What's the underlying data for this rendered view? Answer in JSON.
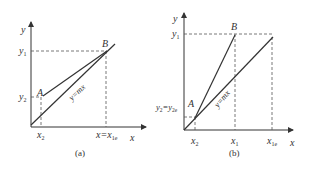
{
  "colors": {
    "line": "#333333",
    "dashed": "#555555",
    "background": "#ffffff"
  },
  "panel_a": {
    "caption": "(a)",
    "axis_x_label": "x",
    "axis_y_label": "y",
    "point_a_label": "A",
    "point_b_label": "B",
    "line_label": "y=mx",
    "y_tick_1": "y",
    "y_tick_1_sub": "1",
    "y_tick_2": "y",
    "y_tick_2_sub": "2",
    "x_tick_2": "x",
    "x_tick_2_sub": "2",
    "x_tick_1e": "x=x",
    "x_tick_1e_sub": "1e"
  },
  "panel_b": {
    "caption": "(b)",
    "axis_x_label": "x",
    "axis_y_label": "y",
    "point_a_label": "A",
    "point_b_label": "B",
    "line_label": "y=mx",
    "y_tick_1": "y",
    "y_tick_1_sub": "1",
    "y_tick_2": "y",
    "y_tick_2_sub": "2",
    "y_tick_2e_eq": "=y",
    "y_tick_2e_sub": "2e",
    "x_tick_2": "x",
    "x_tick_2_sub": "2",
    "x_tick_1": "x",
    "x_tick_1_sub": "1",
    "x_tick_1e": "x",
    "x_tick_1e_sub": "1e"
  }
}
